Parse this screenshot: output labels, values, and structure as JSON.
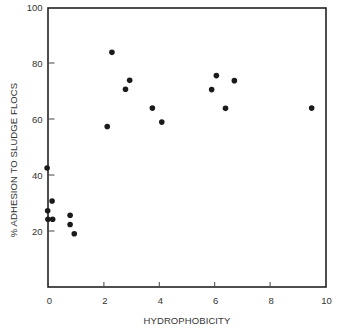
{
  "chart_data": {
    "type": "scatter",
    "title": "",
    "xlabel": "HYDROPHOBICITY",
    "ylabel": "% ADHESION TO SLUDGE FLOCS",
    "xlim": [
      0,
      10
    ],
    "ylim": [
      0,
      100
    ],
    "xticks": [
      0,
      2,
      4,
      6,
      8,
      10
    ],
    "yticks": [
      20,
      40,
      60,
      80,
      100
    ],
    "grid": false,
    "legend": null,
    "marker_color": "#1a1a1a",
    "series": [
      {
        "name": "strains",
        "points": [
          {
            "x": -0.05,
            "y": 42.5
          },
          {
            "x": 0.13,
            "y": 30.7
          },
          {
            "x": -0.03,
            "y": 27.2
          },
          {
            "x": -0.02,
            "y": 24.2
          },
          {
            "x": 0.15,
            "y": 24.2
          },
          {
            "x": 0.78,
            "y": 25.6
          },
          {
            "x": 0.78,
            "y": 22.3
          },
          {
            "x": 0.93,
            "y": 19.0
          },
          {
            "x": 2.12,
            "y": 57.3
          },
          {
            "x": 2.29,
            "y": 83.8
          },
          {
            "x": 2.78,
            "y": 70.6
          },
          {
            "x": 2.93,
            "y": 73.8
          },
          {
            "x": 3.75,
            "y": 63.9
          },
          {
            "x": 4.09,
            "y": 58.9
          },
          {
            "x": 5.89,
            "y": 70.5
          },
          {
            "x": 6.06,
            "y": 75.5
          },
          {
            "x": 6.39,
            "y": 63.8
          },
          {
            "x": 6.71,
            "y": 73.7
          },
          {
            "x": 9.5,
            "y": 63.9
          }
        ]
      }
    ]
  }
}
